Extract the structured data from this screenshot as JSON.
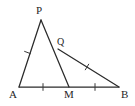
{
  "figure": {
    "kind": "geometry-diagram",
    "canvas": {
      "width": 135,
      "height": 106,
      "background": "#ffffff"
    },
    "stroke_color": "#2b2b2b",
    "label_color": "#262626",
    "points": [
      {
        "name": "P",
        "label": "P",
        "x": 41,
        "y": 20
      },
      {
        "name": "Q",
        "label": "Q",
        "x": 58,
        "y": 49
      },
      {
        "name": "A",
        "label": "A",
        "x": 19,
        "y": 87
      },
      {
        "name": "M",
        "label": "M",
        "x": 69,
        "y": 87
      },
      {
        "name": "B",
        "label": "B",
        "x": 119,
        "y": 87
      }
    ],
    "segments": [
      {
        "name": "segment-AP",
        "from": "A",
        "to": "P",
        "ticks": 1
      },
      {
        "name": "segment-PM",
        "from": "P",
        "to": "M",
        "ticks": 0
      },
      {
        "name": "segment-AB",
        "from": "A",
        "to": "B",
        "ticks": 0
      },
      {
        "name": "segment-QB",
        "from": "Q",
        "to": "B",
        "ticks": 1
      },
      {
        "name": "segment-AM",
        "from": "A",
        "to": "M",
        "ticks": 1
      },
      {
        "name": "segment-MB",
        "from": "M",
        "to": "B",
        "ticks": 1
      }
    ],
    "tick_marks": [
      {
        "name": "tick-AP",
        "on": "segment-AP",
        "x": 27.5,
        "y": 52.5
      },
      {
        "name": "tick-AM",
        "on": "segment-AM",
        "x": 43,
        "y": 87
      },
      {
        "name": "tick-MB",
        "on": "segment-MB",
        "x": 95,
        "y": 87
      },
      {
        "name": "tick-QB",
        "on": "segment-QB",
        "x": 87,
        "y": 67
      }
    ]
  }
}
